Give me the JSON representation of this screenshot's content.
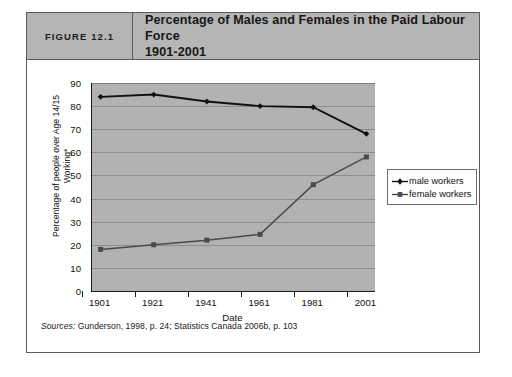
{
  "figure": {
    "number_label": "FIGURE 12.1",
    "title_line1": "Percentage of Males and Females in the Paid Labour Force",
    "title_line2": "1901-2001",
    "sources_word": "Sources:",
    "sources_text": " Gunderson, 1998, p. 24; Statistics Canada 2006b, p. 103"
  },
  "colors": {
    "header_band": "#b5b5b5",
    "plot_background": "#b2b2b2",
    "gridline": "#8d8d8d",
    "male_series": "#111111",
    "female_series": "#4a4a4a",
    "frame_border": "#5a5a5a"
  },
  "chart_data": {
    "type": "line",
    "title": "Percentage of Males and Females in the Paid Labour Force 1901-2001",
    "xlabel": "Date",
    "ylabel": "Percentage of people over Age 14/15 Working*",
    "ylabel_line1": "Percentage of people over Age 14/15",
    "ylabel_line2": "Working*",
    "categories": [
      "1901",
      "1921",
      "1941",
      "1961",
      "1981",
      "2001"
    ],
    "x": [
      1901,
      1921,
      1941,
      1961,
      1981,
      2001
    ],
    "ylim": [
      0,
      90
    ],
    "yticks": [
      0,
      10,
      20,
      30,
      40,
      50,
      60,
      70,
      80,
      90
    ],
    "grid": "horizontal",
    "legend_position": "right",
    "series": [
      {
        "name": "male workers",
        "marker": "diamond",
        "values": [
          84,
          85,
          82,
          80,
          79.5,
          68
        ]
      },
      {
        "name": "female workers",
        "marker": "square",
        "values": [
          18,
          20,
          22,
          24.5,
          46,
          58
        ]
      }
    ]
  }
}
